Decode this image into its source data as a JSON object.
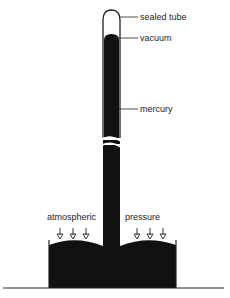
{
  "diagram": {
    "labels": {
      "sealed_tube": "sealed tube",
      "vacuum": "vacuum",
      "mercury": "mercury",
      "atmospheric": "atmospheric",
      "pressure": "pressure"
    },
    "colors": {
      "mercury": "#111111",
      "line": "#222222",
      "background": "#ffffff"
    }
  }
}
